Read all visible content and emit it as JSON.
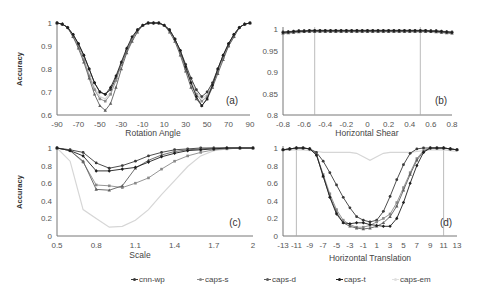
{
  "chart_data": [
    {
      "id": "a",
      "type": "line",
      "panel_label": "(a)",
      "title": "",
      "xlabel": "Rotation Angle",
      "ylabel": "Accuracy",
      "xlim": [
        -90,
        90
      ],
      "ylim": [
        0.6,
        1.0
      ],
      "xticks": [
        -90,
        -70,
        -50,
        -30,
        -10,
        10,
        30,
        50,
        70,
        90
      ],
      "yticks": [
        0.6,
        0.7,
        0.8,
        0.9,
        1.0
      ],
      "ytick_labels": [
        "0.6",
        "0.7",
        "0.8",
        "0.9",
        "1"
      ],
      "grid": false,
      "x": [
        -90,
        -85,
        -80,
        -75,
        -70,
        -65,
        -60,
        -55,
        -50,
        -45,
        -40,
        -35,
        -30,
        -25,
        -20,
        -15,
        -10,
        -5,
        0,
        5,
        10,
        15,
        20,
        25,
        30,
        35,
        40,
        45,
        50,
        55,
        60,
        65,
        70,
        75,
        80,
        85,
        90
      ],
      "series": [
        {
          "name": "cnn-wp",
          "values": [
            1.0,
            0.995,
            0.98,
            0.95,
            0.91,
            0.86,
            0.8,
            0.74,
            0.7,
            0.69,
            0.71,
            0.76,
            0.82,
            0.88,
            0.93,
            0.97,
            0.99,
            1.0,
            1.0,
            1.0,
            0.99,
            0.97,
            0.93,
            0.88,
            0.82,
            0.76,
            0.71,
            0.68,
            0.7,
            0.74,
            0.8,
            0.86,
            0.91,
            0.95,
            0.98,
            0.995,
            1.0
          ]
        },
        {
          "name": "caps-s",
          "values": [
            1.0,
            0.995,
            0.98,
            0.94,
            0.9,
            0.84,
            0.77,
            0.71,
            0.67,
            0.66,
            0.69,
            0.75,
            0.82,
            0.88,
            0.93,
            0.97,
            0.99,
            1.0,
            1.0,
            1.0,
            0.99,
            0.97,
            0.93,
            0.87,
            0.8,
            0.74,
            0.69,
            0.66,
            0.68,
            0.73,
            0.79,
            0.85,
            0.9,
            0.94,
            0.98,
            0.995,
            1.0
          ]
        },
        {
          "name": "caps-d",
          "values": [
            1.0,
            0.995,
            0.98,
            0.94,
            0.89,
            0.83,
            0.76,
            0.69,
            0.64,
            0.62,
            0.65,
            0.72,
            0.8,
            0.87,
            0.92,
            0.96,
            0.99,
            1.0,
            1.0,
            1.0,
            0.99,
            0.96,
            0.92,
            0.86,
            0.79,
            0.72,
            0.67,
            0.64,
            0.67,
            0.72,
            0.78,
            0.84,
            0.9,
            0.94,
            0.98,
            0.995,
            1.0
          ]
        },
        {
          "name": "caps-t",
          "values": [
            1.0,
            0.995,
            0.98,
            0.95,
            0.91,
            0.86,
            0.8,
            0.74,
            0.7,
            0.69,
            0.72,
            0.77,
            0.83,
            0.89,
            0.94,
            0.97,
            0.99,
            1.0,
            1.0,
            1.0,
            0.99,
            0.97,
            0.93,
            0.88,
            0.81,
            0.74,
            0.68,
            0.64,
            0.67,
            0.73,
            0.8,
            0.86,
            0.91,
            0.95,
            0.98,
            0.995,
            1.0
          ]
        },
        {
          "name": "caps-em",
          "values": [
            1.0,
            0.995,
            0.98,
            0.94,
            0.9,
            0.85,
            0.78,
            0.72,
            0.68,
            0.67,
            0.7,
            0.76,
            0.82,
            0.88,
            0.93,
            0.97,
            0.99,
            1.0,
            1.0,
            1.0,
            0.99,
            0.97,
            0.93,
            0.87,
            0.81,
            0.75,
            0.7,
            0.67,
            0.69,
            0.74,
            0.8,
            0.86,
            0.91,
            0.95,
            0.98,
            0.995,
            1.0
          ]
        }
      ]
    },
    {
      "id": "b",
      "type": "line",
      "panel_label": "(b)",
      "title": "",
      "xlabel": "Horizontal Shear",
      "ylabel": "",
      "xlim": [
        -0.8,
        0.8
      ],
      "ylim": [
        0.8,
        1.0
      ],
      "xticks": [
        -0.8,
        -0.6,
        -0.4,
        -0.2,
        0,
        0.2,
        0.4,
        0.6,
        0.8
      ],
      "yticks": [
        0.8,
        0.85,
        0.9,
        0.95,
        1.0
      ],
      "ytick_labels": [
        "0.8",
        "0.85",
        "0.9",
        "0.95",
        "1"
      ],
      "vlines": [
        -0.5,
        0.5
      ],
      "grid": false,
      "x": [
        -0.8,
        -0.75,
        -0.7,
        -0.65,
        -0.6,
        -0.55,
        -0.5,
        -0.45,
        -0.4,
        -0.35,
        -0.3,
        -0.25,
        -0.2,
        -0.15,
        -0.1,
        -0.05,
        0,
        0.05,
        0.1,
        0.15,
        0.2,
        0.25,
        0.3,
        0.35,
        0.4,
        0.45,
        0.5,
        0.55,
        0.6,
        0.65,
        0.7,
        0.75,
        0.8
      ],
      "series": [
        {
          "name": "cnn-wp",
          "values": [
            0.993,
            0.994,
            0.995,
            0.996,
            0.996,
            0.997,
            0.997,
            0.997,
            0.997,
            0.997,
            0.997,
            0.997,
            0.997,
            0.997,
            0.997,
            0.997,
            0.997,
            0.997,
            0.997,
            0.997,
            0.997,
            0.997,
            0.997,
            0.997,
            0.997,
            0.997,
            0.997,
            0.997,
            0.996,
            0.996,
            0.995,
            0.994,
            0.993
          ]
        },
        {
          "name": "caps-s",
          "values": [
            0.991,
            0.992,
            0.993,
            0.994,
            0.995,
            0.995,
            0.995,
            0.995,
            0.995,
            0.995,
            0.995,
            0.995,
            0.995,
            0.995,
            0.995,
            0.995,
            0.995,
            0.995,
            0.995,
            0.995,
            0.995,
            0.995,
            0.995,
            0.995,
            0.995,
            0.995,
            0.995,
            0.995,
            0.995,
            0.994,
            0.993,
            0.992,
            0.991
          ]
        },
        {
          "name": "caps-d",
          "values": [
            0.99,
            0.991,
            0.992,
            0.993,
            0.994,
            0.994,
            0.994,
            0.994,
            0.994,
            0.994,
            0.994,
            0.994,
            0.994,
            0.994,
            0.994,
            0.994,
            0.994,
            0.994,
            0.994,
            0.994,
            0.994,
            0.994,
            0.994,
            0.994,
            0.994,
            0.994,
            0.994,
            0.994,
            0.994,
            0.993,
            0.992,
            0.991,
            0.99
          ]
        },
        {
          "name": "caps-t",
          "values": [
            0.992,
            0.993,
            0.994,
            0.995,
            0.995,
            0.996,
            0.996,
            0.996,
            0.996,
            0.996,
            0.996,
            0.996,
            0.996,
            0.996,
            0.996,
            0.996,
            0.996,
            0.996,
            0.996,
            0.996,
            0.996,
            0.996,
            0.996,
            0.996,
            0.996,
            0.996,
            0.996,
            0.996,
            0.995,
            0.995,
            0.994,
            0.993,
            0.992
          ]
        },
        {
          "name": "caps-em",
          "values": [
            0.99,
            0.99,
            0.991,
            0.992,
            0.993,
            0.993,
            0.993,
            0.993,
            0.993,
            0.993,
            0.993,
            0.993,
            0.993,
            0.993,
            0.993,
            0.993,
            0.993,
            0.993,
            0.993,
            0.993,
            0.993,
            0.993,
            0.993,
            0.993,
            0.993,
            0.993,
            0.993,
            0.993,
            0.993,
            0.992,
            0.991,
            0.99,
            0.99
          ]
        }
      ]
    },
    {
      "id": "c",
      "type": "line",
      "panel_label": "(c)",
      "title": "",
      "xlabel": "Scale",
      "ylabel": "Accuracy",
      "xlim": [
        0.5,
        2.0
      ],
      "ylim": [
        0,
        1.0
      ],
      "xticks": [
        0.5,
        0.8,
        1.1,
        1.4,
        1.7,
        2.0
      ],
      "xtick_labels": [
        "0.5",
        "0.8",
        "1.1",
        "1.4",
        "1.7",
        "2"
      ],
      "yticks": [
        0,
        0.2,
        0.4,
        0.6,
        0.8,
        1.0
      ],
      "ytick_labels": [
        "0",
        "0.2",
        "0.4",
        "0.6",
        "0.8",
        "1"
      ],
      "grid": false,
      "x": [
        0.5,
        0.6,
        0.7,
        0.8,
        0.9,
        1.0,
        1.1,
        1.2,
        1.3,
        1.4,
        1.5,
        1.6,
        1.7,
        1.8,
        1.9,
        2.0
      ],
      "series": [
        {
          "name": "cnn-wp",
          "values": [
            1.0,
            0.98,
            0.95,
            0.83,
            0.77,
            0.8,
            0.85,
            0.91,
            0.95,
            0.98,
            0.99,
            1.0,
            1.0,
            1.0,
            1.0,
            1.0
          ]
        },
        {
          "name": "caps-s",
          "values": [
            1.0,
            0.97,
            0.84,
            0.58,
            0.57,
            0.55,
            0.6,
            0.66,
            0.76,
            0.85,
            0.91,
            0.95,
            0.98,
            0.99,
            1.0,
            1.0
          ]
        },
        {
          "name": "caps-d",
          "values": [
            1.0,
            0.97,
            0.85,
            0.53,
            0.52,
            0.57,
            0.77,
            0.86,
            0.92,
            0.96,
            0.98,
            0.99,
            1.0,
            1.0,
            1.0,
            1.0
          ]
        },
        {
          "name": "caps-t",
          "values": [
            1.0,
            0.97,
            0.91,
            0.74,
            0.74,
            0.76,
            0.78,
            0.84,
            0.9,
            0.94,
            0.97,
            0.98,
            0.99,
            1.0,
            1.0,
            1.0
          ]
        },
        {
          "name": "caps-em",
          "values": [
            1.0,
            0.85,
            0.3,
            0.2,
            0.1,
            0.11,
            0.18,
            0.3,
            0.47,
            0.63,
            0.79,
            0.91,
            0.97,
            0.99,
            1.0,
            1.0
          ]
        }
      ]
    },
    {
      "id": "d",
      "type": "line",
      "panel_label": "(d)",
      "title": "",
      "xlabel": "Horizontal Translation",
      "ylabel": "",
      "xlim": [
        -13,
        13
      ],
      "ylim": [
        0,
        1.0
      ],
      "xticks": [
        -13,
        -11,
        -9,
        -7,
        -5,
        -3,
        -1,
        1,
        3,
        5,
        7,
        9,
        11,
        13
      ],
      "yticks": [
        0,
        0.2,
        0.4,
        0.6,
        0.8,
        1.0
      ],
      "ytick_labels": [
        "0",
        "0.2",
        "0.4",
        "0.6",
        "0.8",
        "1"
      ],
      "vlines": [
        -11,
        11
      ],
      "grid": false,
      "x": [
        -13,
        -12,
        -11,
        -10,
        -9,
        -8,
        -7,
        -6,
        -5,
        -4,
        -3,
        -2,
        -1,
        0,
        1,
        2,
        3,
        4,
        5,
        6,
        7,
        8,
        9,
        10,
        11,
        12,
        13
      ],
      "series": [
        {
          "name": "cnn-wp",
          "values": [
            0.98,
            0.99,
            1.0,
            1.0,
            0.99,
            0.95,
            0.85,
            0.72,
            0.58,
            0.44,
            0.32,
            0.22,
            0.18,
            0.16,
            0.18,
            0.28,
            0.45,
            0.64,
            0.81,
            0.94,
            0.99,
            1.0,
            1.0,
            1.0,
            1.0,
            0.99,
            0.98
          ]
        },
        {
          "name": "caps-s",
          "values": [
            0.98,
            0.99,
            1.0,
            1.0,
            0.99,
            0.93,
            0.7,
            0.48,
            0.3,
            0.18,
            0.13,
            0.1,
            0.1,
            0.12,
            0.16,
            0.2,
            0.25,
            0.38,
            0.55,
            0.72,
            0.88,
            0.97,
            1.0,
            1.0,
            1.0,
            0.99,
            0.98
          ]
        },
        {
          "name": "caps-d",
          "values": [
            0.98,
            0.99,
            1.0,
            1.0,
            0.99,
            0.92,
            0.68,
            0.45,
            0.27,
            0.15,
            0.11,
            0.09,
            0.08,
            0.09,
            0.11,
            0.15,
            0.22,
            0.34,
            0.52,
            0.7,
            0.86,
            0.96,
            1.0,
            1.0,
            1.0,
            0.99,
            0.98
          ]
        },
        {
          "name": "caps-t",
          "values": [
            0.98,
            0.99,
            1.0,
            1.0,
            0.99,
            0.92,
            0.68,
            0.44,
            0.25,
            0.15,
            0.14,
            0.15,
            0.15,
            0.13,
            0.12,
            0.11,
            0.11,
            0.2,
            0.38,
            0.6,
            0.8,
            0.95,
            1.0,
            1.0,
            1.0,
            0.99,
            0.98
          ]
        },
        {
          "name": "caps-em",
          "values": [
            0.97,
            0.98,
            0.98,
            0.98,
            0.97,
            0.96,
            0.95,
            0.95,
            0.95,
            0.95,
            0.95,
            0.94,
            0.9,
            0.86,
            0.9,
            0.94,
            0.95,
            0.95,
            0.95,
            0.95,
            0.96,
            0.97,
            0.98,
            0.98,
            0.98,
            0.97,
            0.96
          ]
        }
      ]
    }
  ],
  "legend": {
    "position": "bottom",
    "items": [
      {
        "name": "cnn-wp",
        "label": "cnn-wp",
        "color": "#3a3a3a",
        "marker": "circle"
      },
      {
        "name": "caps-s",
        "label": "caps-s",
        "color": "#8a8a8a",
        "marker": "square"
      },
      {
        "name": "caps-d",
        "label": "caps-d",
        "color": "#5e5e5e",
        "marker": "triangle"
      },
      {
        "name": "caps-t",
        "label": "caps-t",
        "color": "#1e1e1e",
        "marker": "diamond"
      },
      {
        "name": "caps-em",
        "label": "caps-em",
        "color": "#d6d6d6",
        "marker": "none"
      }
    ]
  }
}
